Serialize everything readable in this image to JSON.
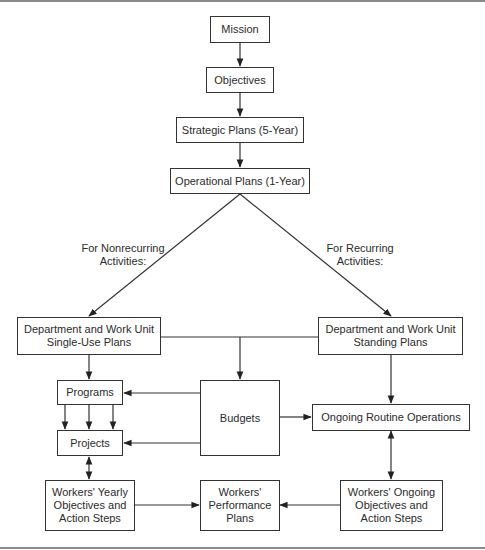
{
  "diagram": {
    "nodes": {
      "mission": "Mission",
      "objectives": "Objectives",
      "strategic": "Strategic Plans (5-Year)",
      "operational": "Operational Plans (1-Year)",
      "single_use": "Department and Work Unit\nSingle-Use Plans",
      "standing": "Department and Work Unit\nStanding Plans",
      "programs": "Programs",
      "projects": "Projects",
      "budgets": "Budgets",
      "routine_ops": "Ongoing Routine Operations",
      "workers_yearly": "Workers' Yearly\nObjectives and\nAction Steps",
      "workers_performance": "Workers'\nPerformance\nPlans",
      "workers_ongoing": "Workers' Ongoing\nObjectives and\nAction Steps"
    },
    "edge_labels": {
      "nonrecurring": "For Nonrecurring\nActivities:",
      "recurring": "For Recurring\nActivities:"
    },
    "edges": [
      {
        "from": "mission",
        "to": "objectives",
        "type": "arrow"
      },
      {
        "from": "objectives",
        "to": "strategic",
        "type": "arrow"
      },
      {
        "from": "strategic",
        "to": "operational",
        "type": "arrow"
      },
      {
        "from": "operational",
        "to": "single_use",
        "type": "arrow",
        "label": "nonrecurring"
      },
      {
        "from": "operational",
        "to": "standing",
        "type": "arrow",
        "label": "recurring"
      },
      {
        "from": "single_use",
        "to": "programs",
        "type": "arrow"
      },
      {
        "from": "single_use/standing",
        "to": "budgets",
        "type": "arrow"
      },
      {
        "from": "standing",
        "to": "routine_ops",
        "type": "arrow"
      },
      {
        "from": "programs",
        "to": "projects",
        "type": "arrow",
        "count": 3
      },
      {
        "from": "budgets",
        "to": "programs",
        "type": "arrow"
      },
      {
        "from": "budgets",
        "to": "projects",
        "type": "arrow"
      },
      {
        "from": "budgets",
        "to": "routine_ops",
        "type": "arrow"
      },
      {
        "from": "projects",
        "to": "workers_yearly",
        "type": "bidirectional"
      },
      {
        "from": "routine_ops",
        "to": "workers_ongoing",
        "type": "bidirectional"
      },
      {
        "from": "workers_yearly",
        "to": "workers_performance",
        "type": "arrow"
      },
      {
        "from": "workers_ongoing",
        "to": "workers_performance",
        "type": "arrow"
      }
    ]
  }
}
